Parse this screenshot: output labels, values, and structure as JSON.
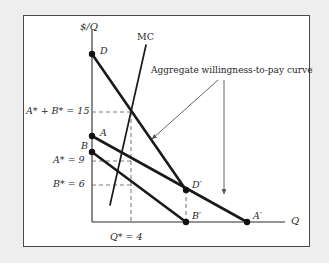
{
  "figure": {
    "type": "economics-diagram",
    "background_color": "#eeeeee",
    "panel_color": "#ffffff",
    "border_color": "#4a4a4a",
    "curve_color": "#1a1a1a",
    "guide_color": "#7d7d7d"
  },
  "axes": {
    "y_axis_label": "$/Q",
    "x_axis_label": "Q",
    "origin": {
      "x": 92,
      "y": 222
    },
    "y_top": 30,
    "x_right": 285
  },
  "curves": [
    {
      "id": "aggregate-demand",
      "start_label": "D",
      "end_label": "D'",
      "start": {
        "x": 92,
        "y": 54
      },
      "end": {
        "x": 186,
        "y": 190
      },
      "style": "thick"
    },
    {
      "id": "demand-a",
      "start_label": "A",
      "end_label": "A'",
      "start": {
        "x": 92,
        "y": 136
      },
      "end": {
        "x": 247,
        "y": 222
      },
      "style": "thick"
    },
    {
      "id": "demand-b",
      "start_label": "B",
      "end_label": "B'",
      "start": {
        "x": 92,
        "y": 152
      },
      "end": {
        "x": 186,
        "y": 222
      },
      "style": "thick"
    },
    {
      "id": "marginal-cost",
      "label": "MC",
      "start": {
        "x": 110,
        "y": 205
      },
      "end": {
        "x": 146,
        "y": 45
      },
      "style": "thin"
    }
  ],
  "points": [
    {
      "name": "D",
      "label": "D",
      "x": 92,
      "y": 54
    },
    {
      "name": "A",
      "label": "A",
      "x": 92,
      "y": 136
    },
    {
      "name": "B",
      "label": "B",
      "x": 92,
      "y": 152
    },
    {
      "name": "Dprime",
      "label": "D'",
      "x": 186,
      "y": 190
    },
    {
      "name": "Bprime",
      "label": "B'",
      "x": 186,
      "y": 222
    },
    {
      "name": "Aprime",
      "label": "A'",
      "x": 247,
      "y": 222
    }
  ],
  "labels": {
    "y_axis": "$/Q",
    "x_axis": "Q",
    "mc_curve": "MC",
    "point_d": "D",
    "point_a": "A",
    "point_b": "B",
    "point_d_prime": "D′",
    "point_b_prime": "B′",
    "point_a_prime": "A′",
    "sum_value": "A* + B* = 15",
    "a_value": "A* = 9",
    "b_value": "B* = 6",
    "q_value": "Q* = 4",
    "annotation": "Aggregate willingness-to-pay curve"
  },
  "values": {
    "A_star": 9,
    "B_star": 6,
    "A_star_plus_B_star": 15,
    "Q_star": 4
  },
  "guides": [
    {
      "name": "sum-level-dashed",
      "from": {
        "x": 92,
        "y": 112
      },
      "to": {
        "x": 131,
        "y": 112
      }
    },
    {
      "name": "a-level-dashed",
      "from": {
        "x": 92,
        "y": 161
      },
      "to": {
        "x": 131,
        "y": 161
      }
    },
    {
      "name": "b-level-dashed",
      "from": {
        "x": 92,
        "y": 185
      },
      "to": {
        "x": 131,
        "y": 185
      }
    },
    {
      "name": "q-star-dashed",
      "from": {
        "x": 131,
        "y": 112
      },
      "to": {
        "x": 131,
        "y": 222
      }
    },
    {
      "name": "d-prime-dashed",
      "from": {
        "x": 186,
        "y": 190
      },
      "to": {
        "x": 186,
        "y": 222
      }
    }
  ],
  "annotation_arrows": [
    {
      "name": "arrow-to-aggregate-curve",
      "from": {
        "x": 218,
        "y": 80
      },
      "to": {
        "x": 152,
        "y": 139
      }
    },
    {
      "name": "arrow-to-demand-a",
      "from": {
        "x": 224,
        "y": 80
      },
      "to": {
        "x": 224,
        "y": 194
      }
    }
  ]
}
